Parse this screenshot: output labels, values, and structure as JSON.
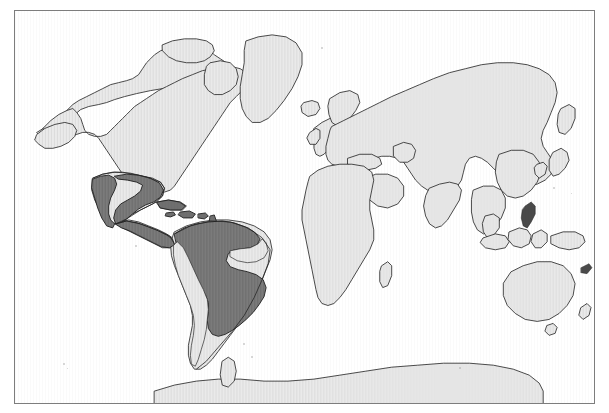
{
  "figure": {
    "kind": "world-distribution-map",
    "projection": "equirectangular",
    "frame": {
      "x": 14,
      "y": 10,
      "width": 581,
      "height": 394,
      "border_color": "#7d7d7d"
    },
    "background_color": "#ffffff"
  },
  "legend_colors": {
    "land_fill": "#e9e9e9",
    "range_fill": "#787878",
    "coastline_stroke": "#2b2b2b",
    "frame_stroke": "#7d7d7d",
    "ocean_fill": "#ffffff"
  },
  "layers": [
    {
      "name": "ocean",
      "label": "Ocean",
      "color": "#ffffff"
    },
    {
      "name": "land",
      "label": "Land",
      "color": "#e9e9e9"
    },
    {
      "name": "distribution-range",
      "label": "Distribution range",
      "color": "#787878"
    }
  ],
  "landmasses": [
    {
      "name": "north-america",
      "label": "North America",
      "shaded": false
    },
    {
      "name": "greenland",
      "label": "Greenland",
      "shaded": false
    },
    {
      "name": "iceland",
      "label": "Iceland",
      "shaded": false
    },
    {
      "name": "mexico",
      "label": "Mexico",
      "shaded": true
    },
    {
      "name": "central-america",
      "label": "Central America",
      "shaded": true
    },
    {
      "name": "caribbean",
      "label": "Caribbean Islands",
      "shaded": true
    },
    {
      "name": "south-america",
      "label": "South America",
      "shaded": true
    },
    {
      "name": "europe",
      "label": "Europe",
      "shaded": false
    },
    {
      "name": "africa",
      "label": "Africa",
      "shaded": false
    },
    {
      "name": "asia",
      "label": "Asia",
      "shaded": false
    },
    {
      "name": "india",
      "label": "India",
      "shaded": false
    },
    {
      "name": "southeast-asia",
      "label": "Southeast Asia",
      "shaded": false
    },
    {
      "name": "japan",
      "label": "Japan",
      "shaded": false
    },
    {
      "name": "philippines",
      "label": "Philippines",
      "shaded": false
    },
    {
      "name": "indonesia",
      "label": "Indonesia",
      "shaded": false
    },
    {
      "name": "australia",
      "label": "Australia",
      "shaded": false
    },
    {
      "name": "new-zealand",
      "label": "New Zealand",
      "shaded": false
    },
    {
      "name": "antarctica",
      "label": "Antarctica",
      "shaded": false
    }
  ],
  "range_regions": [
    {
      "name": "range-mexico",
      "label": "Mexico coastal lowlands"
    },
    {
      "name": "range-central-america",
      "label": "Central America"
    },
    {
      "name": "range-caribbean",
      "label": "Greater and Lesser Antilles"
    },
    {
      "name": "range-amazonia",
      "label": "Amazon Basin and northern South America"
    },
    {
      "name": "range-southern-cone",
      "label": "Northern Argentina and Paraguay"
    }
  ]
}
